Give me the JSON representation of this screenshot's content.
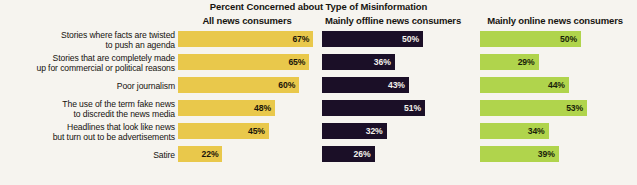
{
  "chart_data": {
    "type": "bar",
    "title": "Percent Concerned about Type of Misinformation",
    "xlabel": "",
    "ylabel": "",
    "orientation": "horizontal",
    "grid": false,
    "legend_position": "column-headers",
    "value_suffix": "%",
    "xlim": [
      0,
      70
    ],
    "categories": [
      {
        "line1": "Stories where facts are twisted",
        "line2": "to push an agenda"
      },
      {
        "line1": "Stories that are completely made",
        "line2": "up for commercial or political reasons"
      },
      {
        "line1": "Poor journalism",
        "line2": ""
      },
      {
        "line1": "The use of the term fake news",
        "line2": "to discredit the news media"
      },
      {
        "line1": "Headlines that look like news",
        "line2": "but turn out to be advertisements"
      },
      {
        "line1": "Satire",
        "line2": ""
      }
    ],
    "series": [
      {
        "name": "All news consumers",
        "color": "#e9c84b",
        "values": [
          67,
          65,
          60,
          48,
          45,
          22
        ],
        "labels": [
          "67%",
          "65%",
          "60%",
          "48%",
          "45%",
          "22%"
        ]
      },
      {
        "name": "Mainly offline news consumers",
        "color": "#1b0f27",
        "values": [
          50,
          36,
          43,
          51,
          32,
          26
        ],
        "labels": [
          "50%",
          "36%",
          "43%",
          "51%",
          "32%",
          "26%"
        ]
      },
      {
        "name": "Mainly online news consumers",
        "color": "#b0d44c",
        "values": [
          50,
          29,
          44,
          53,
          34,
          39
        ],
        "labels": [
          "50%",
          "29%",
          "44%",
          "53%",
          "34%",
          "39%"
        ]
      }
    ],
    "px_per_unit": 2.02,
    "background_color": "#f6f4ef"
  }
}
